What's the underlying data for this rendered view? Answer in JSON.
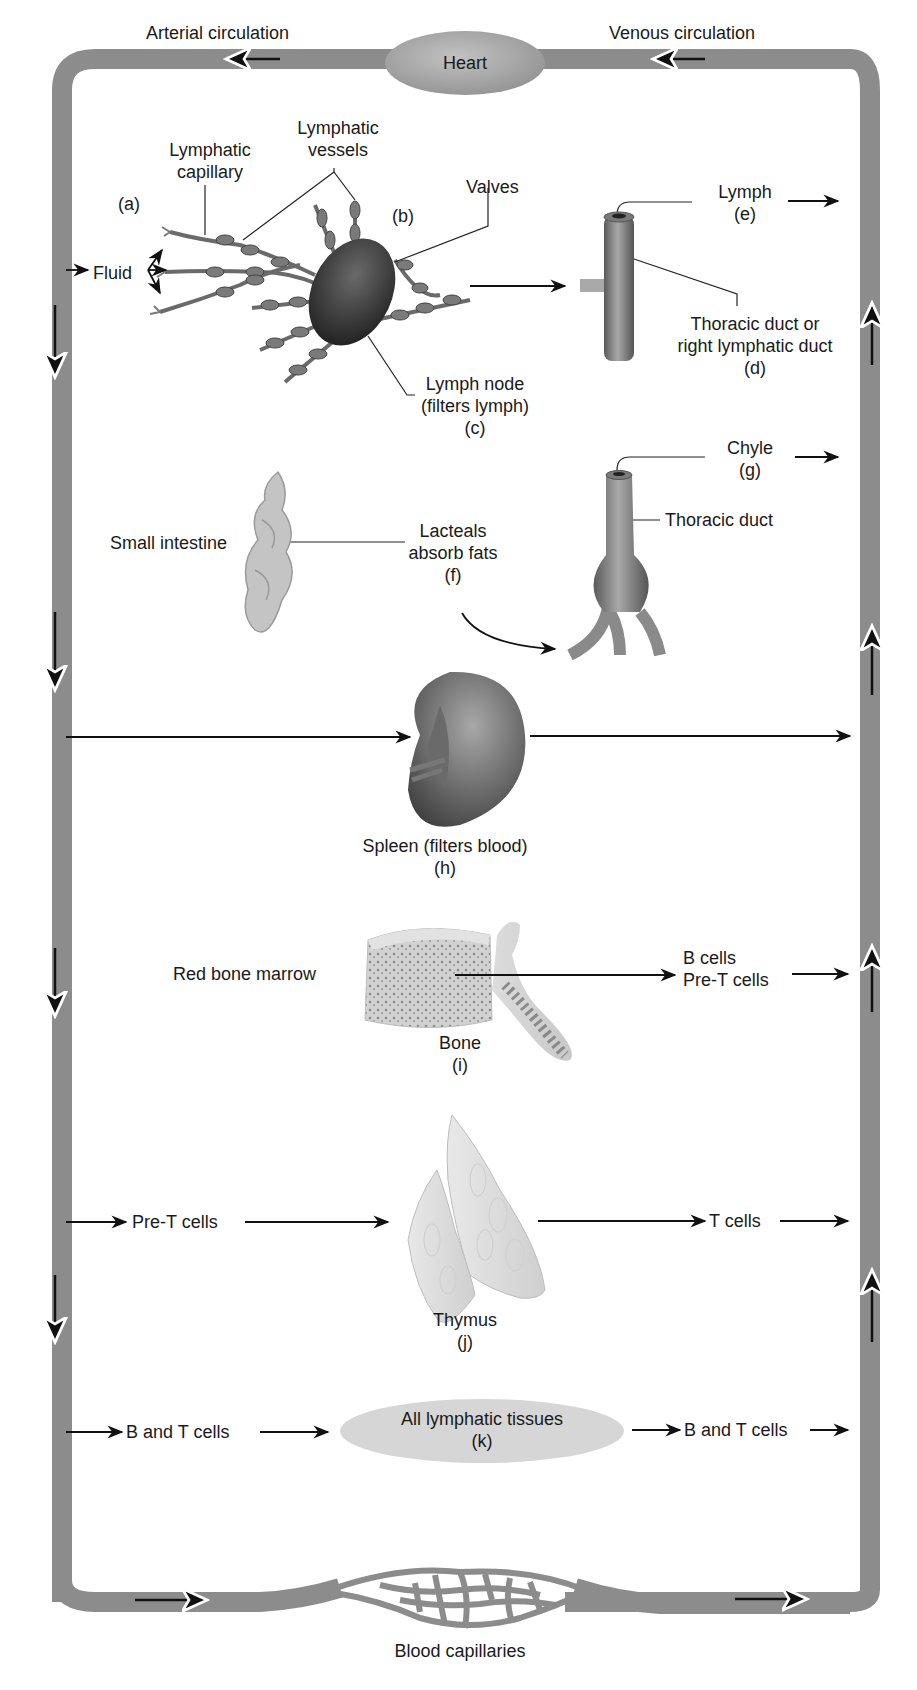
{
  "circulation": {
    "arterial_label": "Arterial circulation",
    "venous_label": "Venous circulation",
    "heart_label": "Heart",
    "capillaries_label": "Blood capillaries",
    "tube_color": "#8c8c8c",
    "heart_color": "#a9a9a9"
  },
  "panel_a_b_c": {
    "letter_a": "(a)",
    "letter_b": "(b)",
    "fluid_label": "Fluid",
    "lymphatic_capillary": [
      "Lymphatic",
      "capillary"
    ],
    "lymphatic_vessels": [
      "Lymphatic",
      "vessels"
    ],
    "valves": "Valves",
    "lymph_node": [
      "Lymph node",
      "(filters lymph)",
      "(c)"
    ]
  },
  "panel_d_e": {
    "lymph": [
      "Lymph",
      "(e)"
    ],
    "duct": [
      "Thoracic duct or",
      "right lymphatic duct",
      "(d)"
    ]
  },
  "panel_f_g": {
    "small_intestine": "Small intestine",
    "lacteals": [
      "Lacteals",
      "absorb fats",
      "(f)"
    ],
    "chyle": [
      "Chyle",
      "(g)"
    ],
    "thoracic_duct": "Thoracic duct"
  },
  "panel_h": {
    "spleen": [
      "Spleen (filters blood)",
      "(h)"
    ]
  },
  "panel_i": {
    "red_bone_marrow": "Red bone marrow",
    "bone": [
      "Bone",
      "(i)"
    ],
    "outputs": [
      "B cells",
      "Pre-T cells"
    ]
  },
  "panel_j": {
    "input": "Pre-T cells",
    "output": "T cells",
    "thymus": [
      "Thymus",
      "(j)"
    ]
  },
  "panel_k": {
    "input": "B and T cells",
    "output": "B and T cells",
    "tissues": [
      "All lymphatic tissues",
      "(k)"
    ],
    "ellipse_color": "#d6d6d6"
  }
}
